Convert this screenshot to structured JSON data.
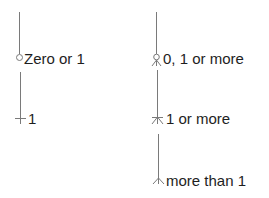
{
  "diagram": {
    "type": "crows-foot-cardinality-legend",
    "line_color": "#7a7a7a",
    "items": [
      {
        "label": "Zero or 1",
        "symbol": "circle-icon"
      },
      {
        "label": "1",
        "symbol": "bar-icon"
      },
      {
        "label": "0, 1 or more",
        "symbol": "circle-crowsfoot-icon"
      },
      {
        "label": "1 or more",
        "symbol": "bar-crowsfoot-icon"
      },
      {
        "label": "more than 1",
        "symbol": "crowsfoot-icon"
      }
    ]
  }
}
